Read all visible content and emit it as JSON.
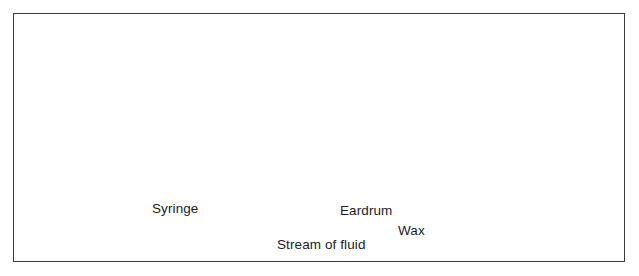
{
  "figure": {
    "style": "grayscale medical cross-section illustration",
    "background_color": "#ffffff",
    "frame_color": "#3a3a3c"
  },
  "labels": [
    {
      "id": "syringe",
      "text": "Syringe",
      "x": 152,
      "y": 202
    },
    {
      "id": "eardrum",
      "text": "Eardrum",
      "x": 340,
      "y": 204
    },
    {
      "id": "wax",
      "text": "Wax",
      "x": 398,
      "y": 224
    },
    {
      "id": "stream-of-fluid",
      "text": "Stream of fluid",
      "x": 277,
      "y": 238
    }
  ],
  "leader_lines": [
    {
      "id": "syringe-leader",
      "from": [
        196,
        200
      ],
      "to": [
        228,
        160
      ]
    },
    {
      "id": "eardrum-leader",
      "from": [
        366,
        201
      ],
      "to": [
        344,
        160
      ]
    },
    {
      "id": "wax-leader",
      "from": [
        409,
        221
      ],
      "to": [
        374,
        158
      ]
    },
    {
      "id": "stream-leader",
      "from": [
        318,
        235
      ],
      "to": [
        311,
        182
      ]
    }
  ],
  "anatomy": {
    "parts": [
      "auricle",
      "ear-canal",
      "mastoid-air-cells",
      "temporal-bone",
      "eardrum",
      "wax-plug",
      "middle-ear"
    ],
    "palette": {
      "bone_light": "#e3e3e3",
      "bone_mid": "#c9c9c9",
      "tissue": "#b4b4b4",
      "canal_shadow": "#9a9a9a",
      "wax_dark": "#141414",
      "outline": "#7d7d7d"
    }
  },
  "syringe": {
    "parts": [
      "thumb-rest",
      "plunger-rod",
      "finger-flange",
      "ribbed-barrel",
      "nozzle"
    ],
    "palette": {
      "body_light": "#fbfbfb",
      "body_mid": "#dcdcdc",
      "body_shadow": "#9f9f9f",
      "metal_dark": "#3b3b3b"
    }
  },
  "fluid": {
    "description": "Stream of fluid flowing into and out of the ear canal",
    "arrow_color": "#1a1a1a",
    "inflow_streams": 4,
    "outflow_streams": 4
  }
}
